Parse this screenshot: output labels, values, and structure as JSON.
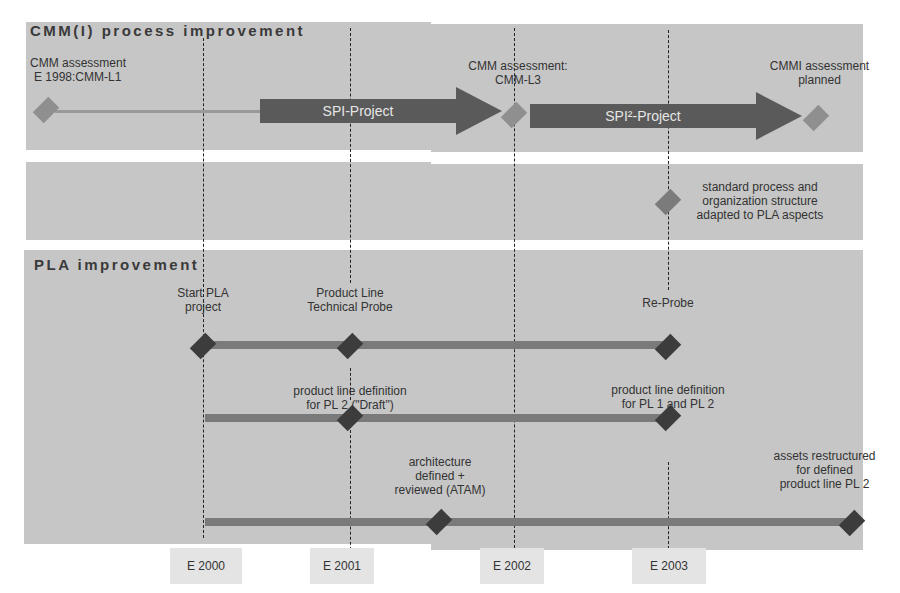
{
  "sections": {
    "cmm": {
      "title": "CMM(I) process improvement"
    },
    "pla": {
      "title": "PLA improvement"
    }
  },
  "cmm_milestones": [
    {
      "label_line1": "CMM assessment",
      "label_line2": "E 1998:CMM-L1"
    },
    {
      "label_line1": "CMM assessment:",
      "label_line2": "CMM-L3"
    },
    {
      "label_line1": "CMMI assessment",
      "label_line2": "planned"
    }
  ],
  "cmm_projects": [
    {
      "label": "SPI-Project"
    },
    {
      "label": "SPI²-Project"
    }
  ],
  "process_adaptation": {
    "line1": "standard process and",
    "line2": "organization structure",
    "line3": "adapted to PLA aspects"
  },
  "pla_milestones": {
    "start": {
      "line1": "Start PLA",
      "line2": "project"
    },
    "probe": {
      "line1": "Product Line",
      "line2": "Technical Probe"
    },
    "reprobe": {
      "line1": "Re-Probe"
    },
    "pl2_draft": {
      "line1": "product line definition",
      "line2": "for PL 2 (\"Draft\")"
    },
    "pl12": {
      "line1": "product line definition",
      "line2": "for PL 1 and PL 2"
    },
    "atam": {
      "line1": "architecture",
      "line2": "defined +",
      "line3": "reviewed (ATAM)"
    },
    "assets": {
      "line1": "assets restructured",
      "line2": "for defined",
      "line3": "product line PL 2"
    }
  },
  "years": [
    "E 2000",
    "E 2001",
    "E 2002",
    "E 2003"
  ],
  "colors": {
    "band": "#c6c6c6",
    "arrow": "#5a5a5a",
    "diamond_light": "#8f8f8f",
    "diamond_dark": "#3c3c3c",
    "bar": "#7a7a7a"
  }
}
